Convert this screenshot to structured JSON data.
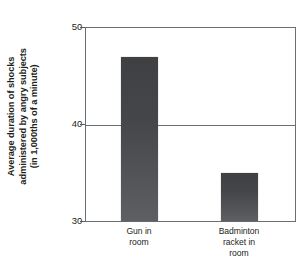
{
  "chart_data": {
    "type": "bar",
    "title": "",
    "subtitle": "",
    "xlabel": "",
    "ylabel": "Average duration of shocks administered by angry subjects (in 1,000ths of a minute)",
    "ylabel_lines": [
      "Average duration of shocks",
      "administered by angry subjects",
      "(in 1,000ths of a minute)"
    ],
    "categories": [
      "Gun in room",
      "Badminton racket in room"
    ],
    "category_label_lines": [
      [
        "Gun in",
        "room"
      ],
      [
        "Badminton",
        "racket in",
        "room"
      ]
    ],
    "values": [
      47,
      35
    ],
    "ylim": [
      30,
      50
    ],
    "yticks": [
      30,
      40,
      50
    ],
    "ytick_labels": [
      "30",
      "40",
      "50"
    ],
    "gridlines": [
      40
    ],
    "grid": true,
    "legend": null,
    "bar_color": "#4a4b4f",
    "axis_color": "#6d6e71",
    "text_color": "#231f20",
    "background": "#ffffff"
  }
}
